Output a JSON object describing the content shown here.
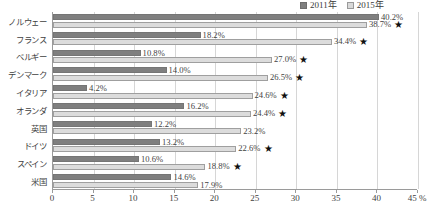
{
  "chart_data": {
    "type": "bar",
    "orientation": "horizontal",
    "title": "",
    "xlabel": "",
    "ylabel": "",
    "xlim": [
      0,
      45
    ],
    "xunit": "%",
    "grid": "vertical",
    "legend_position": "top-right",
    "categories": [
      "ノルウェー",
      "フランス",
      "ベルギー",
      "デンマーク",
      "イタリア",
      "オランダ",
      "英国",
      "ドイツ",
      "スペイン",
      "米国"
    ],
    "series": [
      {
        "name": "2011年",
        "color": "#7f7f7f",
        "values": [
          40.2,
          18.2,
          10.8,
          14.0,
          4.2,
          16.2,
          12.2,
          13.2,
          10.6,
          14.6
        ],
        "labels": [
          "40.2%",
          "18.2%",
          "10.8%",
          "14.0%",
          "4.2%",
          "16.2%",
          "12.2%",
          "13.2%",
          "10.6%",
          "14.6%"
        ]
      },
      {
        "name": "2015年",
        "color": "#dcdcdc",
        "values": [
          38.7,
          34.4,
          27.0,
          26.5,
          24.6,
          24.4,
          23.2,
          22.6,
          18.8,
          17.9
        ],
        "labels": [
          "38.7%",
          "34.4%",
          "27.0%",
          "26.5%",
          "24.6%",
          "24.4%",
          "23.2%",
          "22.6%",
          "18.8%",
          "17.9%"
        ],
        "star_flags": [
          true,
          true,
          true,
          true,
          true,
          true,
          false,
          true,
          true,
          false
        ]
      }
    ],
    "xticks": [
      0,
      5,
      10,
      15,
      20,
      25,
      30,
      35,
      40,
      45
    ],
    "xtick_labels": [
      "0",
      "5",
      "10",
      "15",
      "20",
      "25",
      "30",
      "35",
      "40",
      "45 %"
    ],
    "star_marker": "★"
  }
}
